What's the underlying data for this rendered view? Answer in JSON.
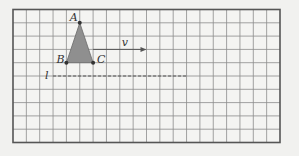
{
  "diagram": {
    "type": "grid-translation",
    "grid": {
      "columns": 20,
      "rows": 10,
      "origin_px": [
        13,
        9.5
      ],
      "cell_px": 13.35,
      "cell_py": 13.3,
      "line_color": "#8c8c8c",
      "border_color": "#555555",
      "background": "#f4f4f2"
    },
    "triangle": {
      "fill": "#8f8f8f",
      "points": [
        {
          "label": "A",
          "grid": [
            5,
            1
          ]
        },
        {
          "label": "B",
          "grid": [
            4,
            4
          ]
        },
        {
          "label": "C",
          "grid": [
            6,
            4
          ]
        }
      ]
    },
    "vector": {
      "label": "v",
      "from": [
        6,
        3
      ],
      "to": [
        10,
        3
      ],
      "color": "#555555"
    },
    "line": {
      "label": "l",
      "from": [
        3,
        5
      ],
      "to": [
        13,
        5
      ],
      "style": "dashed",
      "color": "#555555"
    }
  }
}
